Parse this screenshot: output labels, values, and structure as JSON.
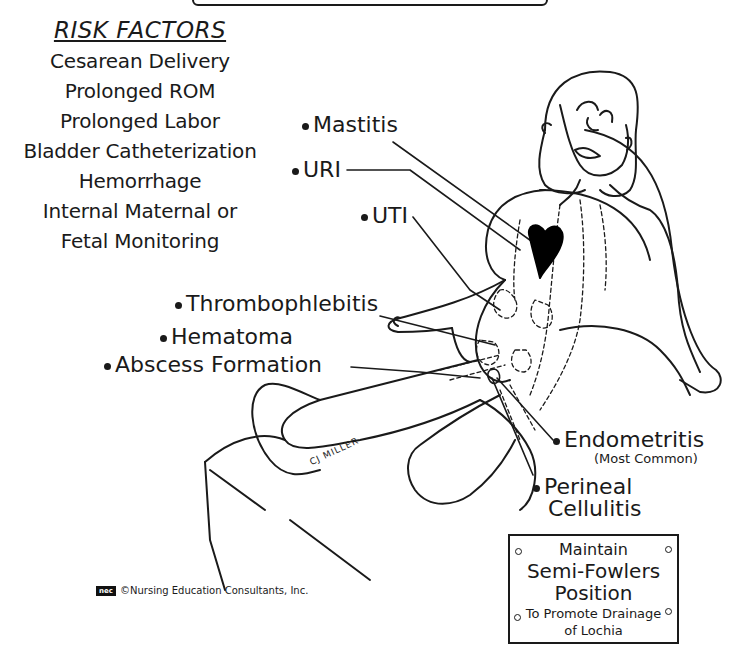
{
  "risk_factors": {
    "title": "RISK FACTORS",
    "items": [
      "Cesarean Delivery",
      "Prolonged ROM",
      "Prolonged Labor",
      "Bladder Catheterization",
      "Hemorrhage",
      "Internal Maternal or",
      "Fetal Monitoring"
    ]
  },
  "infections": {
    "mastitis": "Mastitis",
    "uri": "URI",
    "uti": "UTI",
    "thrombophlebitis": "Thrombophlebitis",
    "hematoma": "Hematoma",
    "abscess": "Abscess Formation",
    "endometritis": "Endometritis",
    "endometritis_note": "(Most Common)",
    "perineal_line1": "Perineal",
    "perineal_line2": "Cellulitis"
  },
  "sign": {
    "line1": "Maintain",
    "line2": "Semi-Fowlers",
    "line3": "Position",
    "line4": "To Promote Drainage",
    "line5": "of Lochia"
  },
  "footer": {
    "logo": "nec",
    "copyright": "©Nursing Education Consultants, Inc."
  },
  "signature": "CJ MILLER",
  "colors": {
    "ink": "#1a1a1a",
    "paper": "#ffffff",
    "heart": "#000000"
  }
}
